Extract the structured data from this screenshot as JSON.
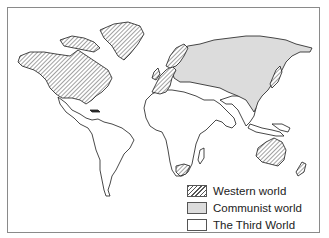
{
  "map": {
    "title": "",
    "regions": [
      {
        "name": "North America (USA, Canada)",
        "category": "western"
      },
      {
        "name": "Greenland",
        "category": "western"
      },
      {
        "name": "Western Europe",
        "category": "western"
      },
      {
        "name": "Scandinavia",
        "category": "western"
      },
      {
        "name": "South Africa",
        "category": "western"
      },
      {
        "name": "Australia",
        "category": "western"
      },
      {
        "name": "New Zealand",
        "category": "western"
      },
      {
        "name": "Japan",
        "category": "western"
      },
      {
        "name": "USSR and Eastern Europe",
        "category": "communist"
      },
      {
        "name": "China",
        "category": "communist"
      },
      {
        "name": "Mongolia",
        "category": "communist"
      },
      {
        "name": "Indochina",
        "category": "communist"
      },
      {
        "name": "Cuba",
        "category": "communist"
      },
      {
        "name": "Latin America",
        "category": "third"
      },
      {
        "name": "Africa",
        "category": "third"
      },
      {
        "name": "Middle East",
        "category": "third"
      },
      {
        "name": "South Asia",
        "category": "third"
      },
      {
        "name": "Southeast Asia",
        "category": "third"
      }
    ]
  },
  "legend": {
    "items": [
      {
        "key": "western",
        "label": "Western world",
        "fill": "hatched"
      },
      {
        "key": "communist",
        "label": "Communist world",
        "fill": "#dcdcdc"
      },
      {
        "key": "third",
        "label": "The Third World",
        "fill": "#ffffff"
      }
    ]
  }
}
